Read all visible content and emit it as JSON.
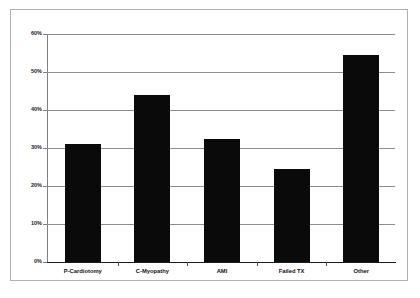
{
  "chart_data": {
    "type": "bar",
    "title": "",
    "subtitle": "",
    "xlabel": "",
    "ylabel": "",
    "categories": [
      "P-Cardiotomy",
      "C-Myopathy",
      "AMI",
      "Failed TX",
      "Other"
    ],
    "values": [
      31,
      44,
      32.5,
      24.5,
      54.5
    ],
    "series": [
      {
        "name": "",
        "values": [
          31,
          44,
          32.5,
          24.5,
          54.5
        ]
      }
    ],
    "ylim": [
      0,
      60
    ],
    "y_tick_labels": [
      "0%",
      "10%",
      "20%",
      "30%",
      "40%",
      "50%",
      "60%"
    ],
    "y_tick_values": [
      0,
      10,
      20,
      30,
      40,
      50,
      60
    ],
    "grid": true,
    "legend": false,
    "legend_position": "none",
    "bar_color": "#0a0a0a",
    "gridline_color": "#8c8c8c",
    "axis_color": "#808080",
    "background_color": "#ffffff",
    "border_color": "#b0b0b0"
  }
}
